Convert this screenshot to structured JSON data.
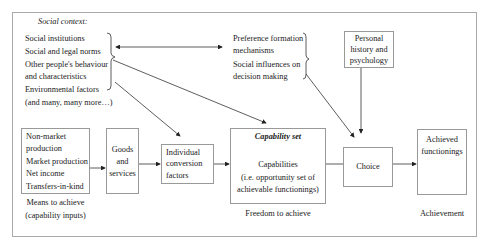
{
  "social_context": {
    "title": "Social context:",
    "items": [
      "Social institutions",
      "Social and legal norms",
      "Other people's behaviour",
      "and characteristics",
      "Environmental factors",
      "(and many, many more…)"
    ]
  },
  "preference": {
    "items": [
      "Preference formation",
      "mechanisms",
      "Social influences on",
      "decision making"
    ]
  },
  "personal_history": {
    "lines": [
      "Personal",
      "history and",
      "psychology"
    ]
  },
  "means_box": {
    "lines": [
      "Non-market",
      "production",
      "Market production",
      "Net income",
      "Transfers-in-kind"
    ],
    "caption": [
      "Means to achieve",
      "(capability inputs)"
    ]
  },
  "goods_box": {
    "lines": [
      "Goods",
      "and",
      "services"
    ]
  },
  "conversion_box": {
    "lines": [
      "Individual",
      "conversion",
      "factors"
    ]
  },
  "capability_box": {
    "title": "Capability set",
    "lines": [
      "Capabilities",
      "(i.e. opportunity set of",
      "achievable functionings)"
    ],
    "caption": "Freedom to achieve"
  },
  "choice_box": {
    "label": "Choice"
  },
  "achieved_box": {
    "lines": [
      "Achieved",
      "functionings"
    ],
    "caption": "Achievement"
  }
}
